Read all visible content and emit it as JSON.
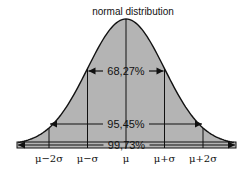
{
  "title": "normal distribution",
  "colors": {
    "fill": "#b4b4b4",
    "stroke": "#111111",
    "background": "#ffffff"
  },
  "chart_data": {
    "type": "area",
    "title": "normal distribution",
    "distribution": "normal",
    "mean_label": "μ",
    "x_range_sigma": [
      -3,
      3
    ],
    "tick_labels": [
      "μ−2σ",
      "μ−σ",
      "μ",
      "μ+σ",
      "μ+2σ"
    ],
    "tick_positions_sigma": [
      -2,
      -1,
      0,
      1,
      2
    ],
    "intervals": [
      {
        "label": "68,27%",
        "from_sigma": -1,
        "to_sigma": 1,
        "percent": 68.27
      },
      {
        "label": "95,45%",
        "from_sigma": -2,
        "to_sigma": 2,
        "percent": 95.45
      },
      {
        "label": "99,73%",
        "from_sigma": -3,
        "to_sigma": 3,
        "percent": 99.73
      }
    ]
  }
}
